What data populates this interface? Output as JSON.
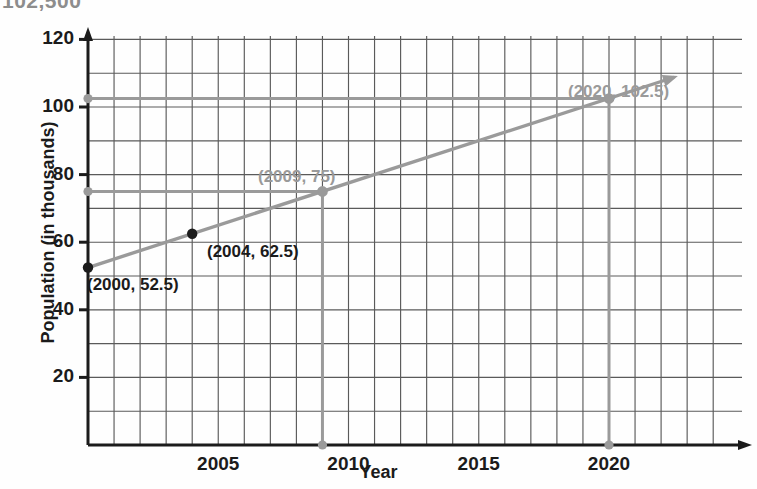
{
  "top_caption": "102,500",
  "chart_data": {
    "type": "line",
    "title": "",
    "xlabel": "Year",
    "ylabel": "Population (in thousands)",
    "xlim": [
      1999,
      2023
    ],
    "ylim": [
      0,
      130
    ],
    "grid": true,
    "grid_x_step": 1,
    "grid_y_step": 10,
    "xticks": [
      "2005",
      "2010",
      "2015",
      "2020"
    ],
    "xtick_values": [
      2005,
      2010,
      2015,
      2020
    ],
    "yticks": [
      "20",
      "40",
      "60",
      "80",
      "100",
      "120"
    ],
    "ytick_values": [
      20,
      40,
      60,
      80,
      100,
      120
    ],
    "legend": [],
    "series": [
      {
        "name": "Population trend line",
        "color": "#9a9a9a",
        "style": "solid-with-arrow",
        "x": [
          2000,
          2022.5
        ],
        "values": [
          52.5,
          108.8
        ]
      }
    ],
    "points": [
      {
        "label": "(2000, 52.5)",
        "x": 2000,
        "y": 52.5,
        "color": "#1b1b1b",
        "marker": "filled-circle"
      },
      {
        "label": "(2004, 62.5)",
        "x": 2004,
        "y": 62.5,
        "color": "#1b1b1b",
        "marker": "filled-circle"
      },
      {
        "label": "(2009, 75)",
        "x": 2009,
        "y": 75,
        "color": "#9a9a9a",
        "marker": "open-circle"
      },
      {
        "label": "(2020, 102.5)",
        "x": 2020,
        "y": 102.5,
        "color": "#9a9a9a",
        "marker": "open-circle"
      }
    ],
    "reference_lines": [
      {
        "value": 75,
        "axis": "y",
        "color": "#9a9a9a",
        "from_x": 2000,
        "to_x": 2009
      },
      {
        "value": 102.5,
        "axis": "y",
        "color": "#9a9a9a",
        "from_x": 2000,
        "to_x": 2020
      },
      {
        "value": 2009,
        "axis": "x",
        "color": "#9a9a9a",
        "from_y": 0,
        "to_y": 75
      },
      {
        "value": 2020,
        "axis": "x",
        "color": "#9a9a9a",
        "from_y": 0,
        "to_y": 102.5
      }
    ],
    "annotations": [
      {
        "text": "(2000, 52.5)",
        "color": "#1b1b1b"
      },
      {
        "text": "(2004, 62.5)",
        "color": "#1b1b1b"
      },
      {
        "text": "(2009, 75)",
        "color": "#9a9a9a"
      },
      {
        "text": "(2020, 102.5)",
        "color": "#9a9a9a"
      }
    ],
    "colors": {
      "axis": "#1b1b1b",
      "grid": "#5a5a5a",
      "line": "#9a9a9a",
      "point_black": "#1b1b1b",
      "point_gray": "#9a9a9a",
      "background": "#fefefe"
    }
  }
}
